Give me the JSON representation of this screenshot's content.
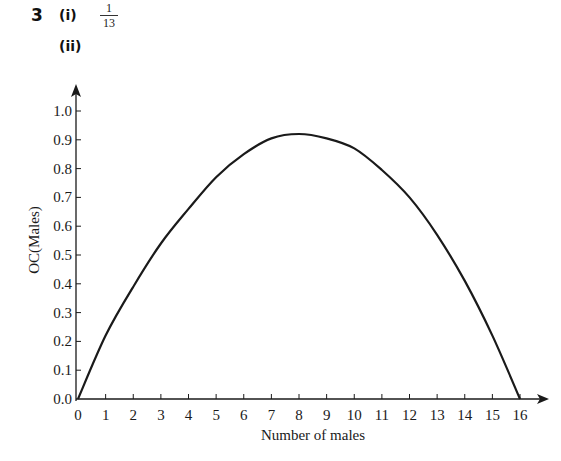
{
  "header": {
    "question_number": "3",
    "part_i_label": "(i)",
    "part_i_answer": {
      "numerator": "1",
      "denominator": "13"
    },
    "part_ii_label": "(ii)"
  },
  "colors": {
    "ink": "#1a1a1a",
    "background": "#ffffff"
  },
  "chart_data": {
    "type": "line",
    "title": "",
    "xlabel": "Number of males",
    "ylabel": "OC(Males)",
    "xlim": [
      0,
      16
    ],
    "ylim": [
      0,
      1.0
    ],
    "grid": false,
    "legend": null,
    "x_ticks": [
      "0",
      "1",
      "2",
      "3",
      "4",
      "5",
      "6",
      "7",
      "8",
      "9",
      "10",
      "11",
      "12",
      "13",
      "14",
      "15",
      "16"
    ],
    "y_ticks": [
      "0.0",
      "0.1",
      "0.2",
      "0.3",
      "0.4",
      "0.5",
      "0.6",
      "0.7",
      "0.8",
      "0.9",
      "1.0"
    ],
    "series": [
      {
        "name": "OC(Males)",
        "x": [
          0,
          1,
          2,
          3,
          4,
          5,
          6,
          7,
          8,
          9,
          10,
          11,
          12,
          13,
          14,
          15,
          16
        ],
        "values": [
          0.0,
          0.22,
          0.39,
          0.54,
          0.66,
          0.77,
          0.85,
          0.905,
          0.92,
          0.905,
          0.87,
          0.795,
          0.7,
          0.57,
          0.41,
          0.22,
          0.0
        ]
      }
    ]
  }
}
